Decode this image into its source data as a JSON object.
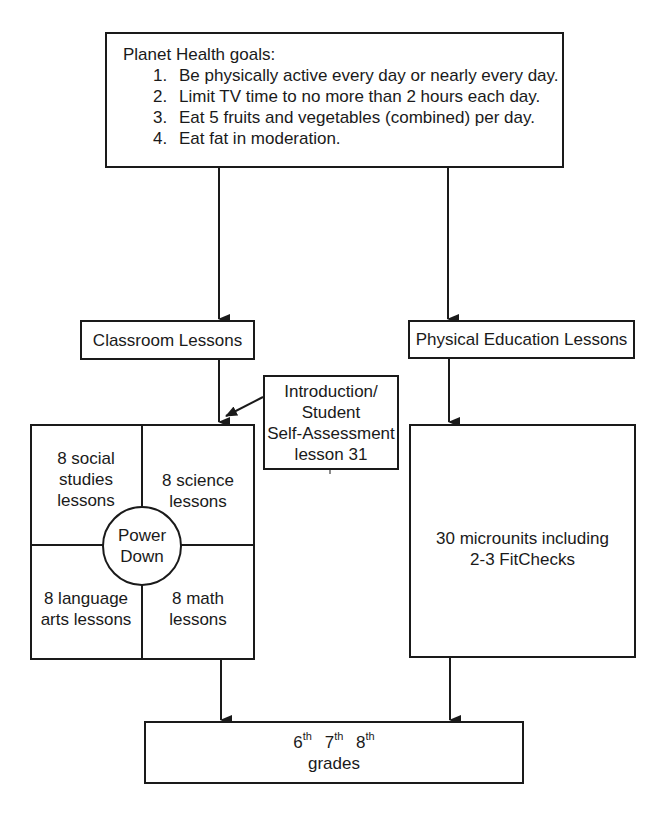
{
  "goals": {
    "title": "Planet Health goals:",
    "items": [
      {
        "num": "1.",
        "text": "Be physically active every day or nearly every day."
      },
      {
        "num": "2.",
        "text": "Limit TV time to no more than 2 hours each day."
      },
      {
        "num": "3.",
        "text": "Eat 5 fruits and vegetables (combined) per day."
      },
      {
        "num": "4.",
        "text": "Eat fat in moderation."
      }
    ]
  },
  "branches": {
    "classroom": "Classroom Lessons",
    "pe": "Physical Education Lessons"
  },
  "intro": {
    "lines": [
      "Introduction/",
      "Student",
      "Self-Assessment",
      "lesson 31"
    ]
  },
  "grid": {
    "top_left": [
      "8 social",
      "studies",
      "lessons"
    ],
    "top_right": [
      "8 science",
      "lessons"
    ],
    "bottom_left": [
      "8 language",
      "arts lessons"
    ],
    "bottom_right": [
      "8 math",
      "lessons"
    ],
    "center": [
      "Power",
      "Down"
    ]
  },
  "pe_content": {
    "lines": [
      "30 microunits including",
      "2-3 FitChecks"
    ]
  },
  "grades": {
    "items": [
      {
        "num": "6",
        "suffix": "th"
      },
      {
        "num": "7",
        "suffix": "th"
      },
      {
        "num": "8",
        "suffix": "th"
      }
    ],
    "label": "grades"
  }
}
